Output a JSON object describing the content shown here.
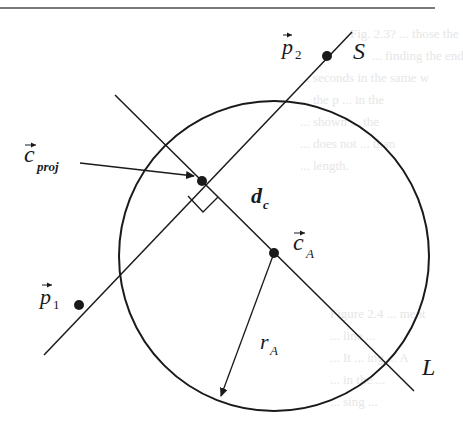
{
  "diagram": {
    "labels": {
      "p2": "p",
      "p2_sub": "2",
      "p1": "p",
      "p1_sub": "1",
      "segment": "S",
      "line": "L",
      "c_proj": "c",
      "c_proj_sub": "proj",
      "d_c": "d",
      "d_c_sub": "c",
      "c_A": "c",
      "c_A_sub": "A",
      "r_A": "r",
      "r_A_sub": "A"
    },
    "background_bleed_text": [
      "Fig. 2.3? ... those the",
      "... finding the end",
      "... seconds in the same w",
      "... the p ... in the",
      "... shown ... the",
      "... does not ... than",
      "... length.",
      "Figure 2.4 ... ment",
      "... line ...",
      "... It ... ing ... A",
      "... in the ...",
      "... sing ..."
    ]
  }
}
